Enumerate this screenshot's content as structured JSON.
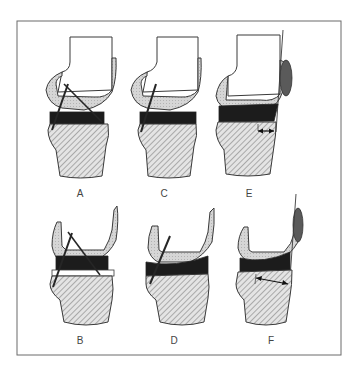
{
  "figure": {
    "colors": {
      "frame": "#6b6b6b",
      "outline": "#3a3a3a",
      "femoral_component_fill": "#d4d4d4",
      "insert_fill": "#1c1c1c",
      "tibia_fill": "#e2e2e2",
      "hatch": "#6e6e6e",
      "patella_fill": "#5a5a5a",
      "ligament": "#262626",
      "label_text": "#444444"
    },
    "panels": [
      {
        "id": "A",
        "label": "A"
      },
      {
        "id": "C",
        "label": "C"
      },
      {
        "id": "E",
        "label": "E"
      },
      {
        "id": "B",
        "label": "B"
      },
      {
        "id": "D",
        "label": "D"
      },
      {
        "id": "F",
        "label": "F"
      }
    ]
  }
}
